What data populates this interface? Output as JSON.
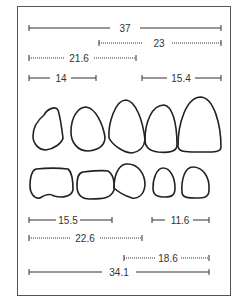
{
  "diagram": {
    "colors": {
      "line": "#333333",
      "frame": "#555555",
      "outline": "#222222",
      "background": "#ffffff"
    },
    "measures_top": [
      {
        "label": "37",
        "style": "solid"
      },
      {
        "label": "23",
        "style": "dotted"
      },
      {
        "label": "21.6",
        "style": "dotted"
      },
      {
        "label": "14",
        "style": "solid"
      },
      {
        "label": "15.4",
        "style": "solid"
      }
    ],
    "measures_bottom": [
      {
        "label": "15.5",
        "style": "solid"
      },
      {
        "label": "11.6",
        "style": "solid"
      },
      {
        "label": "22.6",
        "style": "dotted"
      },
      {
        "label": "18.6",
        "style": "dotted"
      },
      {
        "label": "34.1",
        "style": "solid"
      }
    ],
    "upper_teeth_count": 5,
    "lower_teeth_count": 5
  }
}
